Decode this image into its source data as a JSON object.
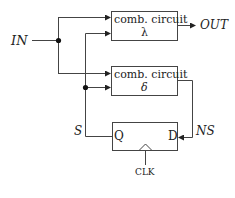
{
  "diagram": {
    "input_label": "IN",
    "output_label": "OUT",
    "state_label": "S",
    "next_state_label": "NS",
    "clock_label": "CLK",
    "boxes": [
      {
        "line1": "comb. circuit",
        "line2": "λ"
      },
      {
        "line1": "comb. circuit",
        "line2": "δ"
      }
    ],
    "flipflop": {
      "q_label": "Q",
      "d_label": "D"
    }
  }
}
